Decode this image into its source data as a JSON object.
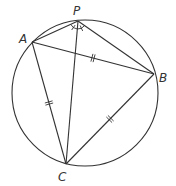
{
  "diagram": {
    "type": "geometry",
    "colors": {
      "line": "#333333",
      "background": "#ffffff"
    },
    "circle": {
      "cx": 85,
      "cy": 93,
      "r": 73
    },
    "points": [
      {
        "id": "P",
        "label": "P",
        "x": 78,
        "y": 21,
        "label_x": 73,
        "label_y": 15
      },
      {
        "id": "A",
        "label": "A",
        "x": 32,
        "y": 42,
        "label_x": 19,
        "label_y": 43
      },
      {
        "id": "B",
        "label": "B",
        "x": 154,
        "y": 74,
        "label_x": 159,
        "label_y": 82
      },
      {
        "id": "C",
        "label": "C",
        "x": 66,
        "y": 164,
        "label_x": 58,
        "label_y": 181
      }
    ],
    "segments": [
      {
        "from": "A",
        "to": "B",
        "ticks": 2
      },
      {
        "from": "A",
        "to": "C",
        "ticks": 2
      },
      {
        "from": "B",
        "to": "C",
        "ticks": 2
      },
      {
        "from": "P",
        "to": "A",
        "ticks": 0
      },
      {
        "from": "P",
        "to": "B",
        "ticks": 0
      },
      {
        "from": "P",
        "to": "C",
        "ticks": 0
      }
    ],
    "angle_marks": [
      {
        "vertex": "P",
        "between": [
          "A",
          "C"
        ],
        "ticks": 1
      },
      {
        "vertex": "P",
        "between": [
          "C",
          "B"
        ],
        "ticks": 1
      }
    ]
  }
}
